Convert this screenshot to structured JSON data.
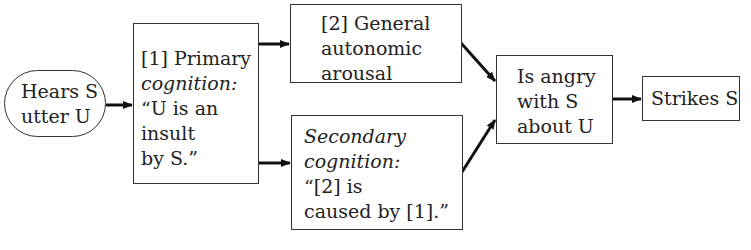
{
  "nodes": {
    "hears": {
      "lines": [
        "Hears S",
        "utter U"
      ]
    },
    "primary": {
      "lines": [
        "[1] Primary",
        "cognition:",
        "“U is an",
        "insult",
        "by S.”"
      ]
    },
    "arousal": {
      "lines": [
        "[2] General",
        "autonomic",
        "arousal"
      ]
    },
    "secondary": {
      "lines": [
        "Secondary",
        "cognition:",
        "“[2] is",
        "caused by [1].”"
      ]
    },
    "angry": {
      "lines": [
        "Is angry",
        "with S",
        "about U"
      ]
    },
    "strikes": {
      "lines": [
        "Strikes S"
      ]
    }
  },
  "edges": [
    {
      "from": "hears",
      "to": "primary"
    },
    {
      "from": "primary",
      "to": "arousal"
    },
    {
      "from": "primary",
      "to": "secondary"
    },
    {
      "from": "arousal",
      "to": "angry"
    },
    {
      "from": "secondary",
      "to": "angry"
    },
    {
      "from": "angry",
      "to": "strikes"
    }
  ]
}
